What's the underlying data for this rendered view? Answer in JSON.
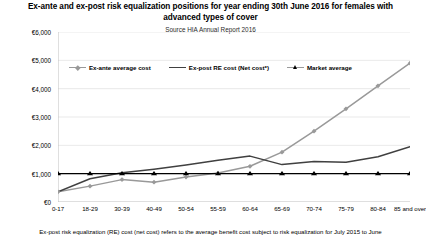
{
  "chart_data": {
    "type": "line",
    "title": "Ex-ante and ex-post risk equalization positions for year ending 30th June 2016 for females with advanced types of cover",
    "subtitle": "Source HIA Annual Report 2016",
    "xlabel": "",
    "ylabel": "",
    "grid": true,
    "legend_position": "top-center",
    "ylim": [
      0,
      6000
    ],
    "ytick_labels": [
      "€0",
      "€1,000",
      "€2,000",
      "€3,000",
      "€4,000",
      "€5,000",
      "€6,000"
    ],
    "ytick_values": [
      0,
      1000,
      2000,
      3000,
      4000,
      5000,
      6000
    ],
    "categories": [
      "0-17",
      "18-29",
      "30-39",
      "40-49",
      "50-54",
      "55-59",
      "60-64",
      "65-69",
      "70-74",
      "75-79",
      "80-84",
      "85 and over"
    ],
    "series": [
      {
        "name": "Ex-ante average cost",
        "color": "#999999",
        "marker": "diamond",
        "values": [
          360,
          560,
          790,
          700,
          880,
          1020,
          1260,
          1760,
          2500,
          3290,
          4100,
          4900
        ]
      },
      {
        "name": "Ex-post RE cost (Net cost*)",
        "color": "#404040",
        "marker": "none",
        "values": [
          360,
          820,
          1030,
          1160,
          1310,
          1470,
          1620,
          1320,
          1430,
          1400,
          1600,
          1950
        ]
      },
      {
        "name": "Market average",
        "color": "#000000",
        "marker": "triangle",
        "values": [
          1000,
          1000,
          1000,
          1000,
          1000,
          1000,
          1000,
          1000,
          1000,
          1000,
          1000,
          1000
        ]
      }
    ]
  },
  "footnote": "Ex-post risk equalization (RE) cost (net cost) refers to the average benefit cost subject to risk equalization for July 2015 to June",
  "colors": {
    "grid": "#e3e3e3",
    "axis": "#bfbfbf",
    "ex_ante": "#999999",
    "ex_post": "#404040",
    "market": "#000000"
  }
}
